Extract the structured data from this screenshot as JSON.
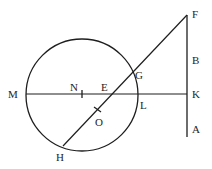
{
  "diagram": {
    "stroke_color": "#1e1e1e",
    "background": "#ffffff",
    "circle": {
      "cx": 82,
      "cy": 95,
      "r": 56
    },
    "lines": {
      "horizontal_MK": {
        "x1": 26,
        "y1": 94,
        "x2": 187,
        "y2": 94
      },
      "vertical_FA": {
        "x1": 187,
        "y1": 15,
        "x2": 187,
        "y2": 137
      },
      "diagonal_FH": {
        "x1": 187,
        "y1": 15,
        "x2": 63,
        "y2": 146
      }
    },
    "ticks": {
      "N": {
        "x1": 82,
        "y1": 90,
        "x2": 82,
        "y2": 98
      },
      "O": {
        "x1": 94,
        "y1": 107,
        "x2": 101,
        "y2": 112
      }
    },
    "labels": {
      "M": {
        "text": "M",
        "x": 8,
        "y": 98
      },
      "N": {
        "text": "N",
        "x": 70,
        "y": 91
      },
      "E": {
        "text": "E",
        "x": 101,
        "y": 91
      },
      "O": {
        "text": "O",
        "x": 95,
        "y": 126
      },
      "G": {
        "text": "G",
        "x": 135,
        "y": 79
      },
      "L": {
        "text": "L",
        "x": 140,
        "y": 109
      },
      "H": {
        "text": "H",
        "x": 56,
        "y": 161
      },
      "F": {
        "text": "F",
        "x": 192,
        "y": 18
      },
      "B": {
        "text": "B",
        "x": 192,
        "y": 64
      },
      "K": {
        "text": "K",
        "x": 192,
        "y": 98
      },
      "A": {
        "text": "A",
        "x": 192,
        "y": 133
      }
    }
  }
}
